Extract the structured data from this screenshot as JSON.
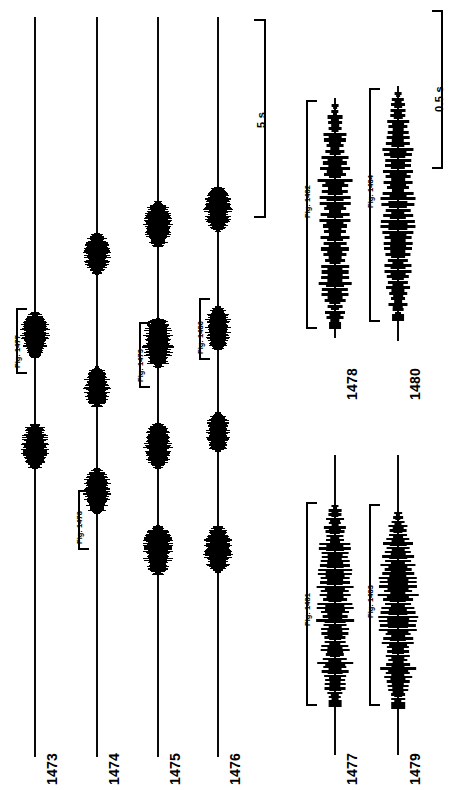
{
  "figure": {
    "kind": "oscillogram-plate",
    "background_color": "#ffffff",
    "ink_color": "#000000"
  },
  "chart_data": {
    "type": "line",
    "title": "",
    "subtitle": "",
    "xlabel": "",
    "ylabel": "",
    "orientation": "rotated-90",
    "panels": [
      {
        "name": "slow-time-base-panel",
        "scale_bar": "5 s",
        "traces": [
          {
            "label": "1473",
            "bursts": [
              {
                "position": 0.43,
                "amplitude": 0.95,
                "expanded_as": "Fig. 1477"
              },
              {
                "position": 0.58,
                "amplitude": 0.9,
                "expanded_as": ""
              }
            ]
          },
          {
            "label": "1474",
            "bursts": [
              {
                "position": 0.32,
                "amplitude": 0.85,
                "expanded_as": ""
              },
              {
                "position": 0.5,
                "amplitude": 0.85,
                "expanded_as": ""
              },
              {
                "position": 0.64,
                "amplitude": 0.92,
                "expanded_as": "Fig. 1478"
              }
            ]
          },
          {
            "label": "1475",
            "bursts": [
              {
                "position": 0.28,
                "amplitude": 0.95,
                "expanded_as": ""
              },
              {
                "position": 0.44,
                "amplitude": 1.0,
                "expanded_as": "Fig. 1479"
              },
              {
                "position": 0.58,
                "amplitude": 0.95,
                "expanded_as": ""
              },
              {
                "position": 0.72,
                "amplitude": 1.0,
                "expanded_as": ""
              }
            ]
          },
          {
            "label": "1476",
            "bursts": [
              {
                "position": 0.26,
                "amplitude": 0.9,
                "expanded_as": ""
              },
              {
                "position": 0.42,
                "amplitude": 0.88,
                "expanded_as": "Fig. 1480"
              },
              {
                "position": 0.56,
                "amplitude": 0.8,
                "expanded_as": ""
              },
              {
                "position": 0.72,
                "amplitude": 0.95,
                "expanded_as": ""
              }
            ]
          }
        ]
      },
      {
        "name": "expanded-time-base-panel",
        "scale_bar": "0.5 s",
        "traces": [
          {
            "label": "1477",
            "source_figure": "Fig. 1481",
            "pulses": 46,
            "envelope": "spindle"
          },
          {
            "label": "1478",
            "source_figure": "Fig. 1482",
            "pulses": 38,
            "envelope": "spindle"
          },
          {
            "label": "1479",
            "source_figure": "Fig. 1483",
            "pulses": 44,
            "envelope": "spindle"
          },
          {
            "label": "1480",
            "source_figure": "Fig. 1484",
            "pulses": 40,
            "envelope": "spindle"
          }
        ]
      }
    ],
    "scale_bars": [
      {
        "label": "5 s",
        "applies_to": "traces 1473-1476"
      },
      {
        "label": "0.5 s",
        "applies_to": "traces 1477-1480"
      }
    ]
  },
  "labels": {
    "trace_numbers": {
      "t1473": "1473",
      "t1474": "1474",
      "t1475": "1475",
      "t1476": "1476",
      "t1477": "1477",
      "t1478": "1478",
      "t1479": "1479",
      "t1480": "1480"
    },
    "figure_callouts": {
      "f1477": "Fig. 1477",
      "f1478": "Fig. 1478",
      "f1479": "Fig. 1479",
      "f1480": "Fig. 1480",
      "f1481": "Fig. 1481",
      "f1482": "Fig. 1482",
      "f1483": "Fig. 1483",
      "f1484": "Fig. 1484"
    },
    "scale_bars": {
      "five_seconds": "5 s",
      "half_second": "0.5 s"
    }
  }
}
